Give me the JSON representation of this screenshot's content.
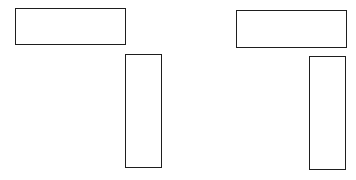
{
  "diagram": {
    "background": "#ffffff",
    "stroke_color": "#1e1e1e",
    "figures": [
      {
        "name": "left-figure",
        "shapes": [
          {
            "name": "left-horizontal-rect",
            "x": 15,
            "y": 8,
            "width": 111,
            "height": 37
          },
          {
            "name": "left-vertical-rect",
            "x": 125,
            "y": 54,
            "width": 37,
            "height": 114
          }
        ]
      },
      {
        "name": "right-figure",
        "shapes": [
          {
            "name": "right-horizontal-rect",
            "x": 236,
            "y": 10,
            "width": 111,
            "height": 38
          },
          {
            "name": "right-vertical-rect",
            "x": 309,
            "y": 56,
            "width": 37,
            "height": 114
          }
        ]
      }
    ]
  }
}
